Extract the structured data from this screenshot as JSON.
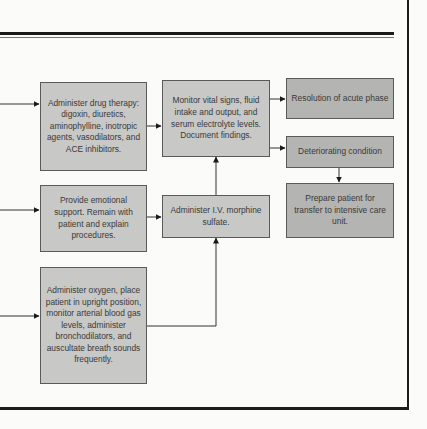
{
  "diagram": {
    "type": "flowchart",
    "boxes": {
      "drug_therapy": "Administer drug therapy: digoxin, diuretics, aminophylline, inotropic agents, vasodilators, and ACE inhibitors.",
      "emotional_support": "Provide emotional support. Remain with patient and explain procedures.",
      "oxygen": "Administer oxygen, place patient in upright position, monitor arterial blood gas levels, administer bronchodilators, and auscultate breath sounds frequently.",
      "monitor": "Monitor vital signs, fluid intake and output, and serum electrolyte levels. Document findings.",
      "morphine": "Administer I.V. morphine sulfate.",
      "resolution": "Resolution of acute phase",
      "deteriorating": "Deteriorating condition",
      "transfer": "Prepare patient for transfer to intensive care unit."
    },
    "edges": [
      [
        "incoming",
        "drug_therapy"
      ],
      [
        "incoming",
        "emotional_support"
      ],
      [
        "incoming",
        "oxygen"
      ],
      [
        "drug_therapy",
        "monitor"
      ],
      [
        "emotional_support",
        "morphine"
      ],
      [
        "oxygen",
        "morphine"
      ],
      [
        "morphine",
        "monitor"
      ],
      [
        "monitor",
        "resolution"
      ],
      [
        "monitor",
        "deteriorating"
      ],
      [
        "deteriorating",
        "transfer"
      ]
    ]
  }
}
